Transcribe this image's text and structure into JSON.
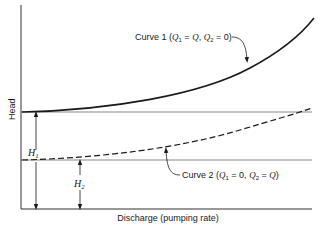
{
  "diagram": {
    "axes": {
      "y_label": "Head",
      "x_label": "Discharge (pumping rate)"
    },
    "curves": [
      {
        "id": "curve-1",
        "label_prefix": "Curve 1 (",
        "q1_sym": "Q",
        "q1_sub": "1",
        "q1_val": " = ",
        "q1_rhs": "Q",
        "sep": ", ",
        "q2_sym": "Q",
        "q2_sub": "2",
        "q2_val": " = 0)",
        "style": "solid"
      },
      {
        "id": "curve-2",
        "label_prefix": "Curve 2 (",
        "q1_sym": "Q",
        "q1_sub": "1",
        "q1_val": " = 0, ",
        "q2_sym": "Q",
        "q2_sub": "2",
        "q2_val": " = ",
        "q2_rhs": "Q",
        "close": ")",
        "style": "dashed"
      }
    ],
    "dimensions": [
      {
        "id": "H1",
        "symbol": "H",
        "sub": "1"
      },
      {
        "id": "H2",
        "symbol": "H",
        "sub": "2"
      }
    ],
    "colors": {
      "ink": "#1a1a1a",
      "ref_line": "#555555",
      "background": "#ffffff"
    }
  }
}
